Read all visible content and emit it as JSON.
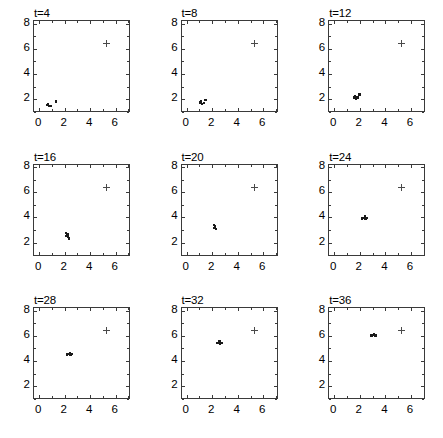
{
  "figure": {
    "layout": {
      "rows": 3,
      "cols": 3
    },
    "panel_titles": [
      "t=4",
      "t=8",
      "t=12",
      "t=16",
      "t=20",
      "t=24",
      "t=28",
      "t=32",
      "t=36"
    ]
  },
  "chart_data": {
    "type": "scatter",
    "title": "",
    "xlabel": "",
    "ylabel": "",
    "xlim": [
      -0.4,
      7.2
    ],
    "ylim": [
      0.9,
      8.2
    ],
    "xticks": [
      0,
      2,
      4,
      6
    ],
    "yticks": [
      2,
      4,
      6,
      8
    ],
    "xtick_labels": [
      "0",
      "2",
      "4",
      "6"
    ],
    "ytick_labels": [
      "2",
      "4",
      "6",
      "8"
    ],
    "x_minor_ticks": [
      1,
      3,
      5,
      7
    ],
    "y_minor_ticks": [
      1,
      3,
      5,
      7
    ],
    "grid": false,
    "legend": false,
    "marker_colors": {
      "agents": "#1a1a1a",
      "target": "#4a4a4a"
    },
    "target_marker": "plus",
    "agent_marker": "dot",
    "panels": [
      {
        "title": "t=4",
        "target": [
          5.3,
          6.4
        ],
        "agents": [
          [
            0.62,
            1.52
          ],
          [
            0.78,
            1.48
          ],
          [
            0.7,
            1.62
          ],
          [
            0.88,
            1.45
          ],
          [
            1.3,
            1.82
          ]
        ]
      },
      {
        "title": "t=8",
        "target": [
          5.3,
          6.4
        ],
        "agents": [
          [
            1.02,
            1.72
          ],
          [
            1.22,
            1.62
          ],
          [
            1.14,
            1.8
          ],
          [
            1.34,
            1.7
          ],
          [
            1.48,
            1.92
          ]
        ]
      },
      {
        "title": "t=12",
        "target": [
          5.3,
          6.4
        ],
        "agents": [
          [
            1.52,
            2.12
          ],
          [
            1.7,
            2.04
          ],
          [
            1.64,
            2.22
          ],
          [
            1.82,
            2.14
          ],
          [
            1.98,
            2.38
          ]
        ]
      },
      {
        "title": "t=16",
        "target": [
          5.3,
          6.4
        ],
        "agents": [
          [
            2.1,
            2.78
          ],
          [
            2.22,
            2.66
          ],
          [
            2.16,
            2.54
          ],
          [
            2.28,
            2.46
          ],
          [
            2.34,
            2.34
          ]
        ]
      },
      {
        "title": "t=20",
        "target": [
          5.3,
          6.4
        ],
        "agents": [
          [
            2.12,
            3.42
          ],
          [
            2.22,
            3.28
          ],
          [
            2.16,
            3.14
          ],
          [
            2.3,
            3.06
          ],
          [
            2.24,
            3.22
          ]
        ]
      },
      {
        "title": "t=24",
        "target": [
          5.3,
          6.4
        ],
        "agents": [
          [
            2.18,
            3.92
          ],
          [
            2.36,
            3.96
          ],
          [
            2.44,
            3.88
          ],
          [
            2.54,
            3.94
          ],
          [
            2.4,
            4.06
          ]
        ]
      },
      {
        "title": "t=28",
        "target": [
          5.3,
          6.4
        ],
        "agents": [
          [
            2.18,
            4.52
          ],
          [
            2.36,
            4.56
          ],
          [
            2.46,
            4.48
          ],
          [
            2.56,
            4.54
          ],
          [
            2.42,
            4.64
          ]
        ]
      },
      {
        "title": "t=32",
        "target": [
          5.3,
          6.4
        ],
        "agents": [
          [
            2.36,
            5.42
          ],
          [
            2.52,
            5.46
          ],
          [
            2.62,
            5.38
          ],
          [
            2.72,
            5.44
          ],
          [
            2.56,
            5.54
          ]
        ]
      },
      {
        "title": "t=36",
        "target": [
          5.3,
          6.4
        ],
        "agents": [
          [
            2.92,
            6.02
          ],
          [
            3.08,
            6.06
          ],
          [
            3.18,
            5.96
          ],
          [
            3.28,
            6.02
          ],
          [
            3.12,
            6.14
          ]
        ]
      }
    ]
  }
}
